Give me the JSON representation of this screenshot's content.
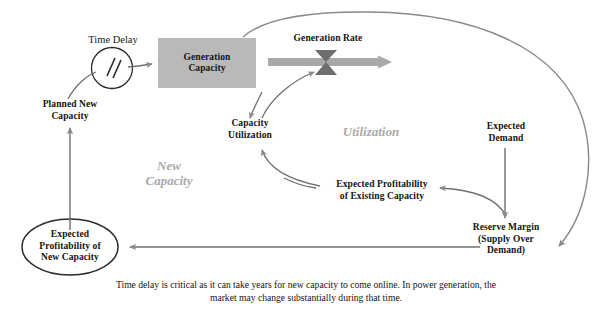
{
  "diagram": {
    "title_note": "Causal loop diagram of power generation capacity dynamics",
    "stock": {
      "name": "Generation Capacity",
      "label": "Generation\nCapacity",
      "fill": "#b9b9b9"
    },
    "flow": {
      "name": "Generation Rate",
      "label": "Generation Rate",
      "pipe_color": "#a8a8a8",
      "valve_color": "#6e6e6e"
    },
    "delay": {
      "name": "Time Delay",
      "label": "Time Delay"
    },
    "variables": [
      {
        "id": "planned_new_capacity",
        "label": "Planned New\nCapacity"
      },
      {
        "id": "capacity_utilization",
        "label": "Capacity\nUtilization"
      },
      {
        "id": "expected_demand",
        "label": "Expected\nDemand"
      },
      {
        "id": "expected_profitability_existing",
        "label": "Expected Profitability\nof Existing Capacity"
      },
      {
        "id": "reserve_margin",
        "label": "Reserve Margin\n(Supply Over\nDemand)"
      },
      {
        "id": "expected_profitability_new",
        "label": "Expected\nProfitability of\nNew Capacity"
      }
    ],
    "loops": [
      {
        "id": "new_capacity_loop",
        "label": "New\nCapacity",
        "color": "#aaaaaa"
      },
      {
        "id": "utilization_loop",
        "label": "Utilization",
        "color": "#aaaaaa"
      }
    ],
    "caption": "Time delay is critical as it can take years for new capacity to come online.  In power generation, the market may change substantially during that time.",
    "link_color": "#6f6f6f",
    "outline_color": "#2b2b2b"
  }
}
